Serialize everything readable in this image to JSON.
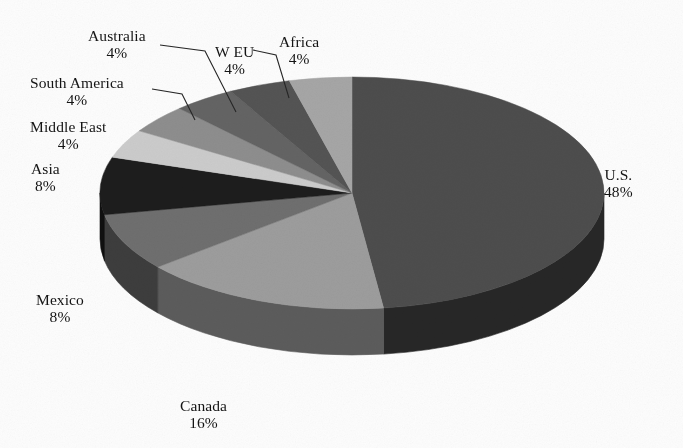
{
  "chart_data": {
    "type": "pie",
    "title": "",
    "subtitle": "",
    "xlabel": "",
    "ylabel": "",
    "legend_position": "none",
    "grid": false,
    "units": "percent",
    "style": "3d-pie-grayscale-scan",
    "categories": [
      "U.S.",
      "Canada",
      "Mexico",
      "Asia",
      "Middle East",
      "South America",
      "Australia",
      "W EU",
      "Africa"
    ],
    "values": [
      48,
      16,
      8,
      8,
      4,
      4,
      4,
      4,
      4
    ],
    "labels": [
      "48%",
      "16%",
      "8%",
      "8%",
      "4%",
      "4%",
      "4%",
      "4%",
      "4%"
    ],
    "total": 100,
    "start_angle_deg": 0,
    "direction": "clockwise",
    "slice_colors": [
      "#4d4d4d",
      "#9d9d9d",
      "#6f6f6f",
      "#1d1d1d",
      "#cccccc",
      "#8e8e8e",
      "#646464",
      "#545454",
      "#a6a6a6"
    ],
    "side_colors": [
      "#272727",
      "#5c5c5c",
      "#3d3d3d",
      "#101010",
      "#7d7d7d",
      "#525252",
      "#393939",
      "#303030",
      "#636363"
    ]
  },
  "slices": [
    {
      "id": "us",
      "name": "U.S.",
      "percent_text": "48%",
      "value": 48,
      "color": "#4d4d4d",
      "side_color": "#272727",
      "label_x": 604,
      "label_y": 166,
      "leader": false
    },
    {
      "id": "canada",
      "name": "Canada",
      "percent_text": "16%",
      "value": 16,
      "color": "#9d9d9d",
      "side_color": "#5c5c5c",
      "label_x": 180,
      "label_y": 397,
      "leader": false
    },
    {
      "id": "mexico",
      "name": "Mexico",
      "percent_text": "8%",
      "value": 8,
      "color": "#6f6f6f",
      "side_color": "#3d3d3d",
      "label_x": 36,
      "label_y": 291,
      "leader": false
    },
    {
      "id": "asia",
      "name": "Asia",
      "percent_text": "8%",
      "value": 8,
      "color": "#1d1d1d",
      "side_color": "#101010",
      "label_x": 31,
      "label_y": 160,
      "leader": false
    },
    {
      "id": "middle-east",
      "name": "Middle East",
      "percent_text": "4%",
      "value": 4,
      "color": "#cccccc",
      "side_color": "#7d7d7d",
      "label_x": 30,
      "label_y": 118,
      "leader": false
    },
    {
      "id": "south-america",
      "name": "South America",
      "percent_text": "4%",
      "value": 4,
      "color": "#8e8e8e",
      "side_color": "#525252",
      "label_x": 30,
      "label_y": 74,
      "leader": true
    },
    {
      "id": "australia",
      "name": "Australia",
      "percent_text": "4%",
      "value": 4,
      "color": "#646464",
      "side_color": "#393939",
      "label_x": 88,
      "label_y": 27,
      "leader": true
    },
    {
      "id": "w-eu",
      "name": "W EU",
      "percent_text": "4%",
      "value": 4,
      "color": "#545454",
      "side_color": "#303030",
      "label_x": 215,
      "label_y": 43,
      "leader": true
    },
    {
      "id": "africa",
      "name": "Africa",
      "percent_text": "4%",
      "value": 4,
      "color": "#a6a6a6",
      "side_color": "#636363",
      "label_x": 279,
      "label_y": 33,
      "leader": false
    }
  ],
  "geometry": {
    "cx": 352,
    "cy": 193,
    "rx": 252,
    "ry": 116,
    "depth": 46
  }
}
